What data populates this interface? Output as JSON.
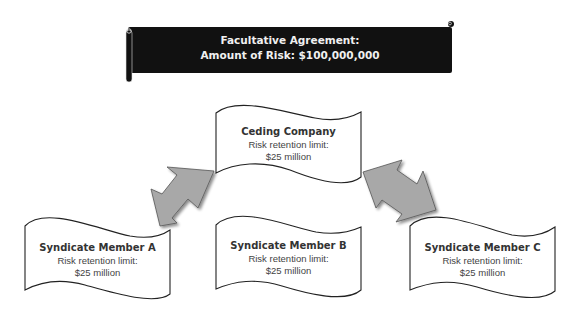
{
  "banner": {
    "line1": "Facultative Agreement:",
    "line2": "Amount of Risk: $100,000,000",
    "color": "#111111"
  },
  "nodes": [
    {
      "id": "ceding",
      "title": "Ceding Company",
      "line1": "Risk retention limit:",
      "line2": "$25 million"
    },
    {
      "id": "member_a",
      "title": "Syndicate Member A",
      "line1": "Risk retention limit:",
      "line2": "$25 million"
    },
    {
      "id": "member_b",
      "title": "Syndicate Member B",
      "line1": "Risk retention limit:",
      "line2": "$25 million"
    },
    {
      "id": "member_c",
      "title": "Syndicate Member C",
      "line1": "Risk retention limit:",
      "line2": "$25 million"
    }
  ],
  "arrows": [
    {
      "from": "ceding",
      "to": "member_a",
      "type": "double-headed",
      "color": "#a6a6a6"
    },
    {
      "from": "ceding",
      "to": "member_c",
      "type": "double-headed",
      "color": "#a6a6a6"
    }
  ]
}
